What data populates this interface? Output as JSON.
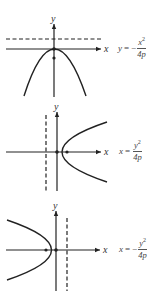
{
  "figures": [
    {
      "id": "graph-1",
      "description": "Parabola opening downward with directrix above",
      "axis_labels": {
        "x": "x",
        "y": "y"
      },
      "equation": {
        "lhs": "y",
        "equals": "=",
        "sign": "−",
        "numerator_var": "x",
        "numerator_exp": "2",
        "denominator": "4p"
      },
      "directrix": "horizontal dashed line above x-axis",
      "focus": "on negative y-axis"
    },
    {
      "id": "graph-2",
      "description": "Parabola opening right with directrix to the left",
      "axis_labels": {
        "x": "x",
        "y": "y"
      },
      "equation": {
        "lhs": "x",
        "equals": "=",
        "sign": "",
        "numerator_var": "y",
        "numerator_exp": "2",
        "denominator": "4p"
      },
      "directrix": "vertical dashed line left of y-axis",
      "focus": "on positive x-axis"
    },
    {
      "id": "graph-3",
      "description": "Parabola opening left with directrix to the right",
      "axis_labels": {
        "x": "x",
        "y": "y"
      },
      "equation": {
        "lhs": "x",
        "equals": "=",
        "sign": "−",
        "numerator_var": "y",
        "numerator_exp": "2",
        "denominator": "4p"
      },
      "directrix": "vertical dashed line right of y-axis",
      "focus": "on negative x-axis"
    }
  ],
  "colors": {
    "ink": "#222222",
    "text": "#444444",
    "background": "#ffffff"
  }
}
